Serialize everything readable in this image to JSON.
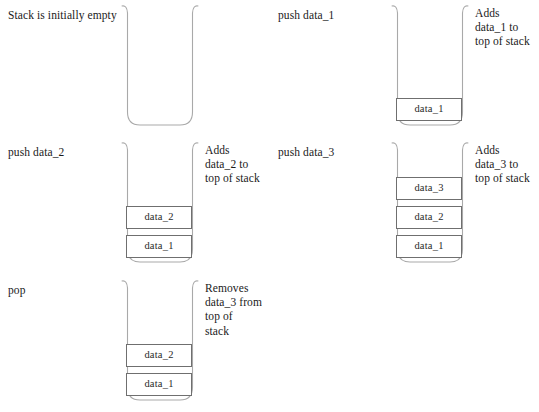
{
  "diagram": {
    "colors": {
      "background": "#ffffff",
      "stack_wall": "#a9a9a9",
      "cell_border": "#6f6f6f",
      "text": "#1a1a1a"
    },
    "steps": [
      {
        "id": "step-initial",
        "operation": "Stack is initially empty",
        "note": [],
        "cells": []
      },
      {
        "id": "step-push-data-1",
        "operation": "push data_1",
        "note": [
          "Adds",
          "data_1 to",
          "top of stack"
        ],
        "cells": [
          "data_1"
        ]
      },
      {
        "id": "step-push-data-2",
        "operation": "push data_2",
        "note": [
          "Adds",
          "data_2 to",
          "top of stack"
        ],
        "cells": [
          "data_1",
          "data_2"
        ]
      },
      {
        "id": "step-push-data-3",
        "operation": "push data_3",
        "note": [
          "Adds",
          "data_3 to",
          "top of stack"
        ],
        "cells": [
          "data_1",
          "data_2",
          "data_3"
        ]
      },
      {
        "id": "step-pop",
        "operation": "pop",
        "note": [
          "Removes",
          "data_3 from",
          "top of",
          "stack"
        ],
        "cells": [
          "data_1",
          "data_2"
        ]
      }
    ]
  }
}
